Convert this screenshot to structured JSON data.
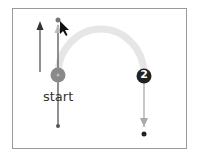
{
  "diagram": {
    "start_label": "start",
    "step_badge": "2",
    "colors": {
      "frame": "#9a9a9a",
      "arc": "#e6e6e6",
      "start_node": "#8a8a8a",
      "step_node": "#222222",
      "line_dark": "#555555",
      "arrow_light": "#aaaaaa"
    }
  }
}
